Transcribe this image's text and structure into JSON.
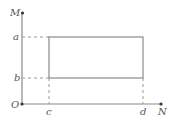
{
  "diagram": {
    "type": "coordinate-rectangle",
    "axes": {
      "vertical_label": "M",
      "horizontal_label": "N",
      "origin_label": "O"
    },
    "horizontal_levels": [
      {
        "label": "a",
        "y": 37
      },
      {
        "label": "b",
        "y": 78
      }
    ],
    "vertical_levels": [
      {
        "label": "c",
        "x": 49
      },
      {
        "label": "d",
        "x": 143
      }
    ],
    "colors": {
      "line": "#8a8a8a",
      "dash": "#9a9a9a",
      "text": "#555555",
      "point": "#333333"
    }
  }
}
